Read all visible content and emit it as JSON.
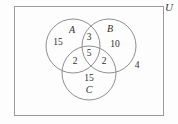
{
  "diagram": {
    "type": "venn-3-set",
    "universe_label": "U",
    "sets": [
      {
        "id": "A",
        "label": "A",
        "label_x": 72,
        "label_y": 30
      },
      {
        "id": "B",
        "label": "B",
        "label_x": 110,
        "label_y": 29
      },
      {
        "id": "C",
        "label": "C",
        "label_x": 89,
        "label_y": 90
      }
    ],
    "regions": [
      {
        "id": "A-only",
        "value": "15",
        "x": 58,
        "y": 43
      },
      {
        "id": "B-only",
        "value": "10",
        "x": 115,
        "y": 45
      },
      {
        "id": "C-only",
        "value": "15",
        "x": 89,
        "y": 79
      },
      {
        "id": "A-and-B",
        "value": "3",
        "x": 89,
        "y": 38
      },
      {
        "id": "A-and-C",
        "value": "2",
        "x": 75,
        "y": 62
      },
      {
        "id": "B-and-C",
        "value": "2",
        "x": 104,
        "y": 62
      },
      {
        "id": "A-and-B-and-C",
        "value": "5",
        "x": 89,
        "y": 54
      },
      {
        "id": "outside-all",
        "value": "4",
        "x": 137,
        "y": 66
      }
    ],
    "circles": [
      {
        "id": "circle-A",
        "cx": 73,
        "cy": 46,
        "r": 27
      },
      {
        "id": "circle-B",
        "cx": 109,
        "cy": 46,
        "r": 27
      },
      {
        "id": "circle-C",
        "cx": 89,
        "cy": 73,
        "r": 27
      }
    ],
    "colors": {
      "stroke": "#8f8f8f",
      "border": "#9a9a9a",
      "text": "#2e2e2e",
      "background": "#fdfdfd"
    }
  }
}
